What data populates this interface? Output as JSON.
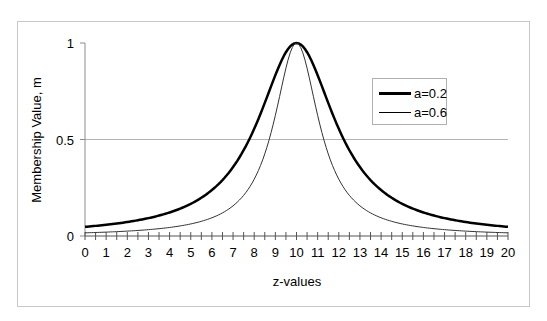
{
  "chart_data": {
    "type": "line",
    "title": "",
    "xlabel": "z-values",
    "ylabel": "Membership Value, m",
    "xlim": [
      0,
      20
    ],
    "ylim": [
      0,
      1
    ],
    "x_ticks": [
      0,
      1,
      2,
      3,
      4,
      5,
      6,
      7,
      8,
      9,
      10,
      11,
      12,
      13,
      14,
      15,
      16,
      17,
      18,
      19,
      20
    ],
    "x_minor_step": 0.5,
    "y_ticks": [
      0,
      0.5,
      1
    ],
    "y_tick_labels": [
      "0",
      "0.5",
      "1"
    ],
    "gridlines": {
      "horizontal": [
        0.5
      ],
      "vertical": []
    },
    "legend_position": "upper right, inside plot",
    "x": [
      0,
      1,
      2,
      3,
      4,
      5,
      6,
      7,
      8,
      9,
      10,
      11,
      12,
      13,
      14,
      15,
      16,
      17,
      18,
      19,
      20
    ],
    "series": [
      {
        "name": "a=0.2",
        "a": 0.2,
        "line_width": 2.5,
        "color": "#000000",
        "values": [
          0.048,
          0.058,
          0.072,
          0.093,
          0.122,
          0.167,
          0.238,
          0.357,
          0.556,
          0.833,
          1.0,
          0.833,
          0.556,
          0.357,
          0.238,
          0.167,
          0.122,
          0.093,
          0.072,
          0.058,
          0.048
        ]
      },
      {
        "name": "a=0.6",
        "a": 0.6,
        "line_width": 1,
        "color": "#333333",
        "values": [
          0.016,
          0.02,
          0.025,
          0.033,
          0.044,
          0.063,
          0.094,
          0.156,
          0.294,
          0.625,
          1.0,
          0.625,
          0.294,
          0.156,
          0.094,
          0.063,
          0.044,
          0.033,
          0.025,
          0.02,
          0.016
        ]
      }
    ]
  },
  "legend": {
    "items": [
      {
        "label": "a=0.2"
      },
      {
        "label": "a=0.6"
      }
    ]
  },
  "axes": {
    "x_title": "z-values",
    "y_title": "Membership Value, m"
  }
}
